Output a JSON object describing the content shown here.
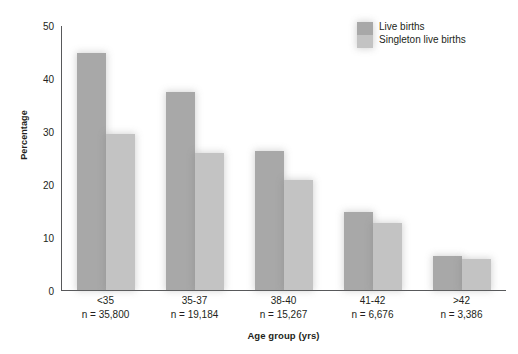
{
  "chart_data": {
    "type": "bar",
    "title": "",
    "xlabel": "Age group (yrs)",
    "ylabel": "Percentage",
    "ylim": [
      0,
      50
    ],
    "yticks": [
      0,
      10,
      20,
      30,
      40,
      50
    ],
    "grid": false,
    "legend_position": "top-right",
    "categories": [
      "<35",
      "35-37",
      "38-40",
      "41-42",
      ">42"
    ],
    "category_sublabels": [
      "n = 35,800",
      "n = 19,184",
      "n = 15,267",
      "n = 6,676",
      "n = 3,386"
    ],
    "series": [
      {
        "name": "Live births",
        "color": "#a8a8a8",
        "values": [
          44.8,
          37.4,
          26.3,
          14.8,
          6.5
        ]
      },
      {
        "name": "Singleton live births",
        "color": "#c3c3c3",
        "values": [
          29.5,
          25.8,
          20.8,
          12.7,
          5.9
        ]
      }
    ]
  }
}
